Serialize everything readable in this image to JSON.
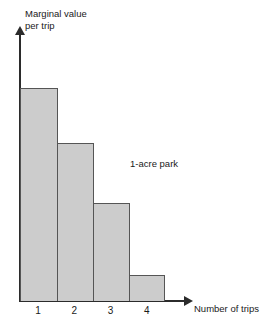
{
  "chart_data": {
    "type": "bar",
    "title": "",
    "categories": [
      "1",
      "2",
      "3",
      "4"
    ],
    "values": [
      100,
      74,
      46,
      12
    ],
    "xlabel": "Number of trips",
    "ylabel_line1": "Marginal value",
    "ylabel_line2": "per trip",
    "annotation": "1-acre park",
    "ylim": [
      0,
      113
    ],
    "grid": false,
    "legend": null,
    "bar_fill_color": "#cccccc",
    "bar_border_color": "#555555",
    "axis_color": "#2b2b2b",
    "background_color": "#ffffff"
  }
}
